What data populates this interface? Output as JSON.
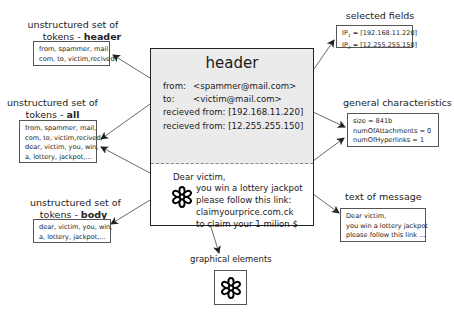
{
  "email": {
    "header_title": "header",
    "header_lines": [
      {
        "label": "from:",
        "value": "<spammer@mail.com>"
      },
      {
        "label": "to:",
        "value": "<victim@mail.com>"
      },
      {
        "label": "recieved from:",
        "value": "[192.168.11.220]"
      },
      {
        "label": "recieved from:",
        "value": "[12.255.255.150]"
      }
    ],
    "body_lines": [
      "Dear victim,",
      "you win a lottery jackpot",
      "please follow this link:",
      "claimyourprice.com.ck",
      "to claim your 1 milion $"
    ],
    "embedded_icon": "flower-icon"
  },
  "left_panels": {
    "header_tokens": {
      "caption_line1": "unstructured set of",
      "caption_prefix": "tokens - ",
      "caption_bold": "header",
      "lines": [
        "from, spammer, mail,",
        "com, to, victim,recived"
      ]
    },
    "all_tokens": {
      "caption_line1": "unstructured set of",
      "caption_prefix": "tokens - ",
      "caption_bold": "all",
      "lines": [
        "from, spammer, mail,",
        "com, to, victim,recived,",
        "dear, victim, you, win,",
        "a, lottery, jackpot,..."
      ]
    },
    "body_tokens": {
      "caption_line1": "unstructured set of",
      "caption_prefix": "tokens - ",
      "caption_bold": "body",
      "lines": [
        "dear, victim, you, win,",
        "a, lottery, jackpot,..."
      ]
    }
  },
  "right_panels": {
    "selected_fields": {
      "caption": "selected fields",
      "lines": [
        {
          "name": "IP",
          "sub": "1",
          "value": " = [192.168.11.220]"
        },
        {
          "name": "IP",
          "sub": "2",
          "value": " = [12.255.255.150]"
        }
      ]
    },
    "general_characteristics": {
      "caption": "general characteristics",
      "lines": [
        "size = 841b",
        "numOfAttachments = 0",
        "numOfHyperlinks = 1"
      ]
    },
    "text_of_message": {
      "caption": "text of message",
      "lines": [
        "Dear victim,",
        "you win a lottery jackpot",
        "please follow this link ..."
      ]
    }
  },
  "bottom_panel": {
    "graphical_elements": {
      "caption": "graphical elements",
      "icon": "flower-icon"
    }
  },
  "colors": {
    "header_bg": "#ebebeb",
    "border": "#222222",
    "arrow": "#333333"
  }
}
